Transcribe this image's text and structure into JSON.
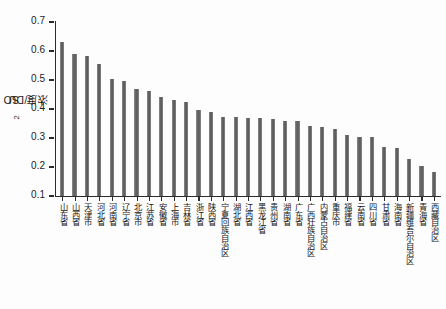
{
  "chart_data": {
    "type": "bar",
    "title": "",
    "xlabel": "",
    "ylabel": "SO2浓度/DU",
    "ylabel_parts": {
      "prefix": "SO",
      "sub": "2",
      "suffix": "浓度/DU"
    },
    "ylim": [
      0.1,
      0.7
    ],
    "ytick_labels": [
      "0.7",
      "0.6",
      "0.5",
      "0.4",
      "0.3",
      "0.2",
      "0.1"
    ],
    "ytick_values": [
      0.7,
      0.6,
      0.5,
      0.4,
      0.3,
      0.2,
      0.1
    ],
    "grid": false,
    "legend": false,
    "bar_color": "#636363",
    "axis_color": "#2b2b2b",
    "categories": [
      "山东省",
      "山西省",
      "天津市",
      "河北省",
      "河南省",
      "辽宁省",
      "北京市",
      "江苏省",
      "安徽省",
      "上海市",
      "吉林省",
      "浙江省",
      "陕西省",
      "宁夏回族自治区",
      "湖北省",
      "江西省",
      "黑龙江省",
      "贵州省",
      "湖南省",
      "广东省",
      "广西壮族自治区",
      "内蒙古自治区",
      "重庆市",
      "福建省",
      "云南省",
      "四川省",
      "甘肃省",
      "海南省",
      "新疆维吾尔自治区",
      "青海省",
      "西藏自治区"
    ],
    "values": [
      0.63,
      0.59,
      0.583,
      0.555,
      0.505,
      0.497,
      0.468,
      0.463,
      0.44,
      0.43,
      0.425,
      0.395,
      0.39,
      0.372,
      0.372,
      0.37,
      0.368,
      0.365,
      0.36,
      0.357,
      0.34,
      0.338,
      0.33,
      0.31,
      0.305,
      0.302,
      0.268,
      0.265,
      0.228,
      0.205,
      0.182
    ]
  }
}
